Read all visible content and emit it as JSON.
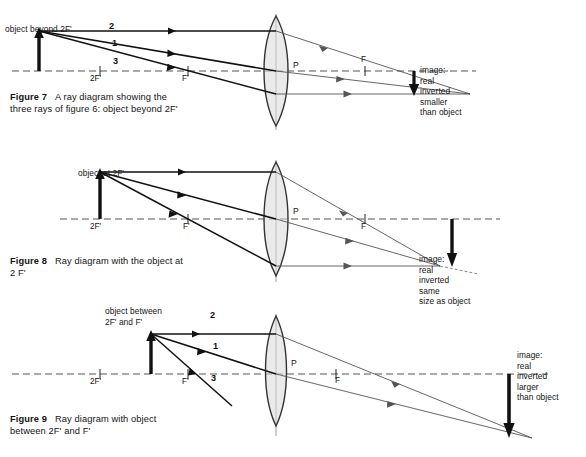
{
  "page": {
    "background": "#ffffff",
    "ink": "#141414"
  },
  "figures": [
    {
      "id": "figure-7",
      "caption_label": "Figure 7",
      "caption_text": "A ray diagram showing the\nthree rays of figure 6: object beyond 2F'",
      "object_label": "object beyond 2F'",
      "ray_numbers": [
        "2",
        "1",
        "3"
      ],
      "axis_marks": [
        "2F'",
        "F'"
      ],
      "image_side_marks": [
        "F"
      ],
      "lens_center_label": "P",
      "image_annotation": "image:\nreal\ninverted\nsmaller\nthan object"
    },
    {
      "id": "figure-8",
      "caption_label": "Figure 8",
      "caption_text": "Ray diagram with the object at\n2 F'",
      "object_label": "object at 2F'",
      "ray_numbers": [
        "2",
        "1",
        "3"
      ],
      "axis_marks": [
        "2F'",
        "F'"
      ],
      "image_side_marks": [
        "F"
      ],
      "lens_center_label": "P",
      "image_annotation": "image:\nreal\ninverted\nsame\nsize as object"
    },
    {
      "id": "figure-9",
      "caption_label": "Figure 9",
      "caption_text": "Ray diagram with object\nbetween 2F' and F'",
      "object_label": "object between\n2F' and F'",
      "ray_numbers": [],
      "axis_marks": [
        "2F'",
        "F'"
      ],
      "image_side_marks": [
        "F"
      ],
      "lens_center_label": "P",
      "image_annotation": "image:\nreal\ninverted\nlarger\nthan object"
    }
  ]
}
